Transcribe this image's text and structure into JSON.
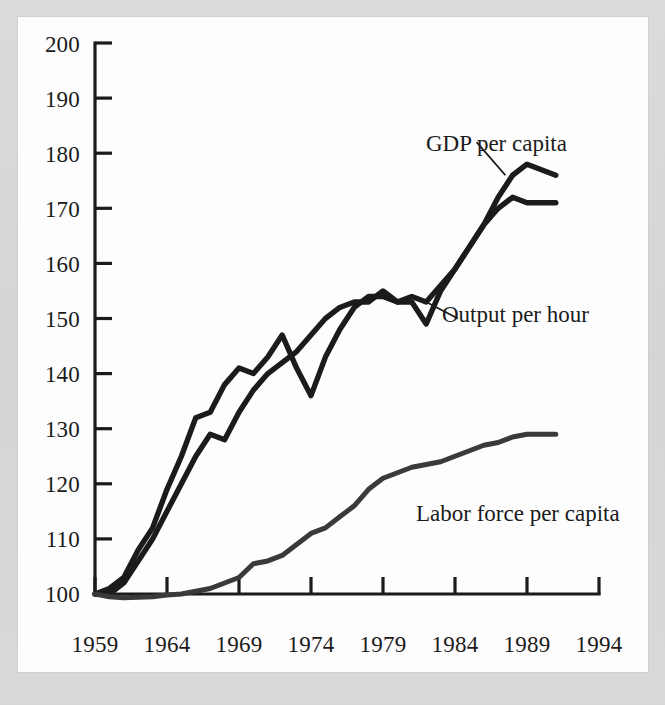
{
  "figure": {
    "background_color": "#d9d9d9",
    "plot_background_color": "#fdfdfd",
    "ink_color": "#1b1b1b"
  },
  "chart_data": {
    "type": "line",
    "title": "",
    "xlabel": "",
    "ylabel": "",
    "xlim": [
      1959,
      1994
    ],
    "ylim": [
      100,
      200
    ],
    "grid": false,
    "legend_position": "inline-annotations",
    "x_tick_labels": [
      "1959",
      "1964",
      "1969",
      "1974",
      "1979",
      "1984",
      "1989",
      "1994"
    ],
    "x_ticks": [
      1959,
      1964,
      1969,
      1974,
      1979,
      1984,
      1989,
      1994
    ],
    "y_tick_labels": [
      "100",
      "110",
      "120",
      "130",
      "140",
      "150",
      "160",
      "170",
      "180",
      "190",
      "200"
    ],
    "y_ticks": [
      100,
      110,
      120,
      130,
      140,
      150,
      160,
      170,
      180,
      190,
      200
    ],
    "x": [
      1959,
      1960,
      1961,
      1962,
      1963,
      1964,
      1965,
      1966,
      1967,
      1968,
      1969,
      1970,
      1971,
      1972,
      1973,
      1974,
      1975,
      1976,
      1977,
      1978,
      1979,
      1980,
      1981,
      1982,
      1983,
      1984,
      1985,
      1986,
      1987,
      1988,
      1989,
      1990,
      1991
    ],
    "series": [
      {
        "name": "GDP per capita",
        "label": "GDP per capita",
        "color": "#1b1b1b",
        "values": [
          100,
          101,
          103,
          108,
          112,
          119,
          125,
          132,
          133,
          138,
          141,
          140,
          143,
          147,
          141,
          136,
          143,
          148,
          152,
          154,
          154,
          153,
          153,
          149,
          155,
          159,
          163,
          167,
          172,
          176,
          178,
          177,
          176
        ]
      },
      {
        "name": "Output per hour",
        "label": "Output per hour",
        "color": "#1b1b1b",
        "values": [
          100,
          100,
          102,
          106,
          110,
          115,
          120,
          125,
          129,
          128,
          133,
          137,
          140,
          142,
          144,
          147,
          150,
          152,
          153,
          153,
          155,
          153,
          154,
          153,
          156,
          159,
          163,
          167,
          170,
          172,
          171,
          171,
          171
        ]
      },
      {
        "name": "Labor force per capita",
        "label": "Labor force per capita",
        "color": "#3a3a3a",
        "values": [
          100,
          99.5,
          99.3,
          99.4,
          99.5,
          99.8,
          100,
          100.5,
          101,
          102,
          103,
          105.5,
          106,
          107,
          109,
          111,
          112,
          114,
          116,
          119,
          121,
          122,
          123,
          123.5,
          124,
          125,
          126,
          127,
          127.5,
          128.5,
          129,
          129,
          129
        ]
      }
    ],
    "annotations": [
      {
        "text": "GDP per capita",
        "x": 1985.5,
        "y": 185,
        "leader_to_x": 1987.5,
        "leader_to_y": 176
      },
      {
        "text": "Output per hour",
        "x": 1984.2,
        "y": 153,
        "leader_to_x": 1982.0,
        "leader_to_y": 153
      },
      {
        "text": "Labor force per capita",
        "x": 1977.0,
        "y": 117,
        "leader_to_x": null,
        "leader_to_y": null
      }
    ]
  }
}
